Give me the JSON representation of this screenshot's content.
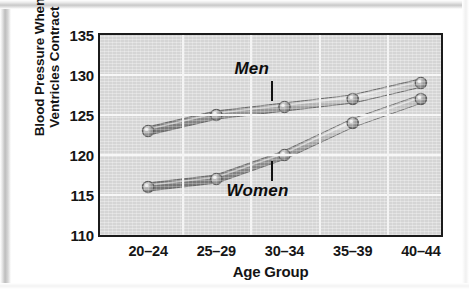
{
  "chart_data": {
    "type": "line",
    "title": "",
    "xlabel": "Age Group",
    "ylabel": "Blood Pressure When Ventricles Contract",
    "ylabel_line1": "Blood Pressure When",
    "ylabel_line2": "Ventricles Contract",
    "categories": [
      "20–24",
      "25–29",
      "30–34",
      "35–39",
      "40–44"
    ],
    "ylim": [
      110,
      135
    ],
    "yticks": [
      110,
      115,
      120,
      125,
      130,
      135
    ],
    "grid": true,
    "legend_position": "inline-annotation",
    "series": [
      {
        "name": "Men",
        "values": [
          123,
          125,
          126,
          127,
          129
        ]
      },
      {
        "name": "Women",
        "values": [
          116,
          117,
          120,
          124,
          127
        ]
      }
    ],
    "annotations": [
      {
        "text": "Men",
        "series": "Men"
      },
      {
        "text": "Women",
        "series": "Women"
      }
    ],
    "colors": {
      "plot_background": "#dcdcdc",
      "gridline": "#f7f7f7",
      "frame": "#1b1b1b",
      "line_men": "#8e8e8e",
      "line_women": "#8e8e8e",
      "marker": "#9a9a9a",
      "text": "#141414"
    }
  }
}
